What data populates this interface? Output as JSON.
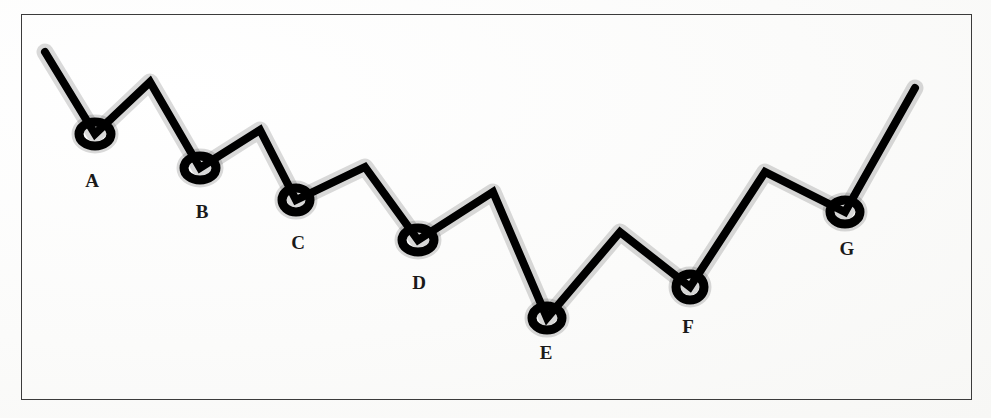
{
  "figure": {
    "background_color": "#fdfdfc",
    "frame_color": "#3b3b3b",
    "line_color": "#000000",
    "marker_color": "#000000",
    "label_color": "#1a1a1a"
  },
  "chart_data": {
    "type": "line",
    "title": "",
    "subtitle": "",
    "xlabel": "",
    "ylabel": "",
    "grid": false,
    "legend": false,
    "axis_ticks": false,
    "xlim": [
      21,
      972
    ],
    "ylim": [
      400,
      14
    ],
    "note": "Zigzag polyline on a scanned page; local minima are circled and lettered A-G. Coordinates are in screenshot pixel space (y increases downward).",
    "series": [
      {
        "name": "zigzag-polyline",
        "points": [
          {
            "x": 45,
            "y": 52,
            "kind": "endpoint",
            "label": ""
          },
          {
            "x": 95,
            "y": 134,
            "kind": "minimum",
            "label": "A"
          },
          {
            "x": 150,
            "y": 82,
            "kind": "maximum",
            "label": ""
          },
          {
            "x": 200,
            "y": 168,
            "kind": "minimum",
            "label": "B"
          },
          {
            "x": 260,
            "y": 130,
            "kind": "maximum",
            "label": ""
          },
          {
            "x": 296,
            "y": 200,
            "kind": "minimum",
            "label": "C"
          },
          {
            "x": 365,
            "y": 167,
            "kind": "maximum",
            "label": ""
          },
          {
            "x": 418,
            "y": 240,
            "kind": "minimum",
            "label": "D"
          },
          {
            "x": 493,
            "y": 192,
            "kind": "maximum",
            "label": ""
          },
          {
            "x": 547,
            "y": 318,
            "kind": "minimum",
            "label": "E"
          },
          {
            "x": 620,
            "y": 232,
            "kind": "maximum",
            "label": ""
          },
          {
            "x": 690,
            "y": 287,
            "kind": "minimum",
            "label": "F"
          },
          {
            "x": 765,
            "y": 172,
            "kind": "maximum",
            "label": ""
          },
          {
            "x": 845,
            "y": 212,
            "kind": "minimum",
            "label": "G"
          },
          {
            "x": 915,
            "y": 88,
            "kind": "endpoint",
            "label": ""
          }
        ]
      }
    ],
    "markers": [
      {
        "label": "A",
        "x": 95,
        "y": 134,
        "rx": 16,
        "ry": 12
      },
      {
        "label": "B",
        "x": 200,
        "y": 168,
        "rx": 16,
        "ry": 12
      },
      {
        "label": "C",
        "x": 296,
        "y": 200,
        "rx": 14,
        "ry": 12
      },
      {
        "label": "D",
        "x": 418,
        "y": 240,
        "rx": 16,
        "ry": 12
      },
      {
        "label": "E",
        "x": 547,
        "y": 318,
        "rx": 15,
        "ry": 12
      },
      {
        "label": "F",
        "x": 690,
        "y": 287,
        "rx": 14,
        "ry": 13
      },
      {
        "label": "G",
        "x": 845,
        "y": 212,
        "rx": 15,
        "ry": 12
      }
    ],
    "labels": [
      {
        "text": "A",
        "x": 92,
        "y": 181
      },
      {
        "text": "B",
        "x": 202,
        "y": 212
      },
      {
        "text": "C",
        "x": 298,
        "y": 243
      },
      {
        "text": "D",
        "x": 419,
        "y": 283
      },
      {
        "text": "E",
        "x": 546,
        "y": 353
      },
      {
        "text": "F",
        "x": 688,
        "y": 327
      },
      {
        "text": "G",
        "x": 847,
        "y": 249
      }
    ]
  }
}
